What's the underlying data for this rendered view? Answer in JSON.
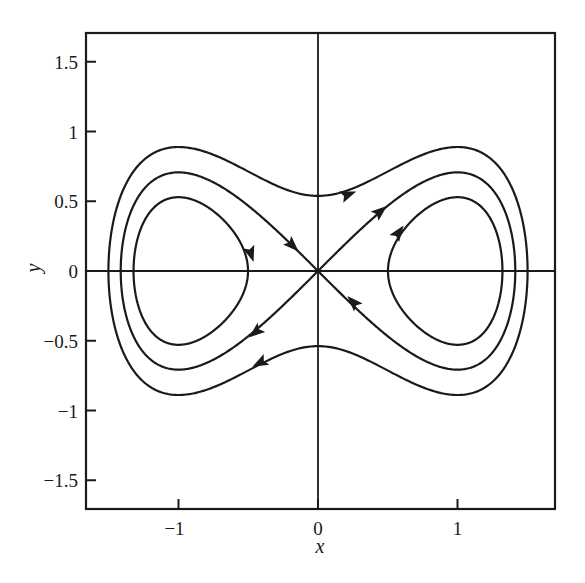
{
  "chart_data": {
    "type": "line",
    "title": "",
    "xlabel": "x",
    "ylabel": "y",
    "xlim": [
      -1.65,
      1.7
    ],
    "ylim": [
      -1.72,
      1.7
    ],
    "grid": false,
    "legend": null,
    "xticks": [
      {
        "value": -1,
        "label": "−1"
      },
      {
        "value": 0,
        "label": "0"
      },
      {
        "value": 1,
        "label": "1"
      }
    ],
    "yticks": [
      {
        "value": 1.5,
        "label": "1.5"
      },
      {
        "value": 1,
        "label": "1"
      },
      {
        "value": 0.5,
        "label": "0.5"
      },
      {
        "value": 0,
        "label": "0"
      },
      {
        "value": -0.5,
        "label": "−0.5"
      },
      {
        "value": -1,
        "label": "−1"
      },
      {
        "value": -1.5,
        "label": "−1.5"
      }
    ],
    "hamiltonian": "y^2/2 - x^2/2 + x^4/4",
    "series": [
      {
        "name": "outer orbit",
        "energy": 0.145,
        "kind": "closed-outer",
        "x_extent": [
          -1.5,
          1.5
        ],
        "y_at_x0": 0.54,
        "direction": "clockwise"
      },
      {
        "name": "separatrix (homoclinic figure-eight)",
        "energy": 0.0,
        "kind": "separatrix",
        "x_extent": [
          -1.414,
          1.414
        ],
        "passes_through": [
          0,
          0
        ],
        "direction": "out along y=x, in along y=-x"
      },
      {
        "name": "inner left orbit",
        "energy": -0.11,
        "kind": "closed-inner-left",
        "x_extent": [
          -1.32,
          -0.5
        ],
        "direction": "clockwise"
      },
      {
        "name": "inner right orbit",
        "energy": -0.11,
        "kind": "closed-inner-right",
        "x_extent": [
          0.5,
          1.32
        ],
        "direction": "clockwise"
      }
    ],
    "arrows": [
      {
        "curve": "outer",
        "x": 0.22,
        "y": 0.55,
        "dir": "right"
      },
      {
        "curve": "outer",
        "x": -0.42,
        "y": -0.66,
        "dir": "left-down"
      },
      {
        "curve": "separatrix",
        "x": -0.18,
        "y": 0.18,
        "dir": "toward-origin"
      },
      {
        "curve": "separatrix",
        "x": 0.45,
        "y": 0.43,
        "dir": "away-from-origin"
      },
      {
        "curve": "separatrix",
        "x": 0.25,
        "y": -0.22,
        "dir": "toward-origin"
      },
      {
        "curve": "separatrix",
        "x": -0.45,
        "y": -0.44,
        "dir": "away-from-origin"
      },
      {
        "curve": "inner-left",
        "x": -0.48,
        "y": 0.12,
        "dir": "down"
      },
      {
        "curve": "inner-right",
        "x": 0.58,
        "y": 0.28,
        "dir": "up"
      }
    ]
  },
  "plot_area": {
    "left_px": 86,
    "top_px": 33,
    "right_px": 555,
    "bottom_px": 509,
    "origin_px": [
      318,
      271
    ],
    "px_per_unit": 139.5
  }
}
